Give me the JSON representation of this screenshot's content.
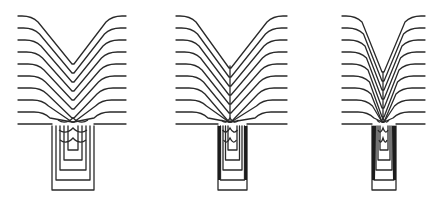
{
  "figure": {
    "panels": [
      {
        "id": "a",
        "center_x": 73,
        "trench": {
          "left": 52,
          "right": 94,
          "top": 126,
          "bottom": 190
        },
        "surface_left": 18,
        "surface_right": 126,
        "layers": 10,
        "note": "layers fill trench with V-shaped cusp"
      },
      {
        "id": "b",
        "center_x": 230,
        "trench": {
          "left": 218,
          "right": 247,
          "top": 126,
          "bottom": 190
        },
        "surface_left": 176,
        "surface_right": 287,
        "layers": 10,
        "note": "narrower trench, thin void forming at center"
      },
      {
        "id": "c",
        "center_x": 383,
        "trench": {
          "left": 372,
          "right": 396,
          "top": 126,
          "bottom": 190
        },
        "surface_left": 342,
        "surface_right": 425,
        "layers": 10,
        "note": "narrowest trench, pronounced keyhole void"
      }
    ],
    "line_color": "#2a2a2a",
    "background": "#ffffff"
  }
}
